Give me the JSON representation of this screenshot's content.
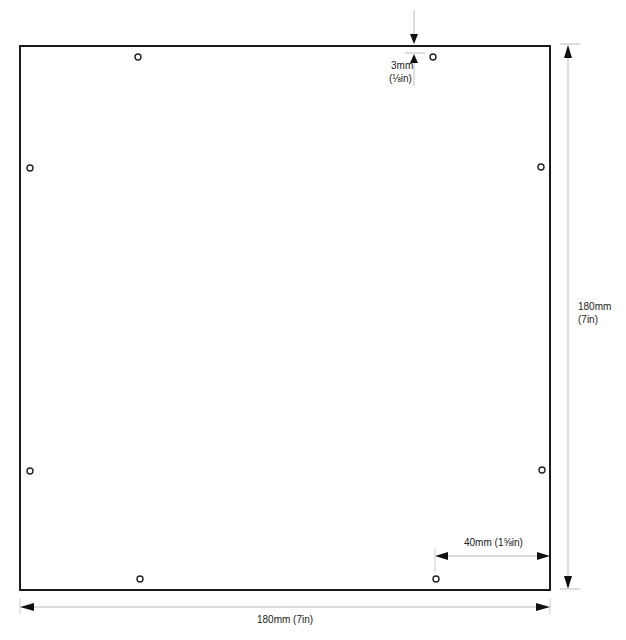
{
  "diagram": {
    "panel": {
      "width_label": "180mm (7in)",
      "height_label_mm": "180mm",
      "height_label_in": "(7in)"
    },
    "edge_offset": {
      "label_mm": "3mm",
      "label_in": "(⅛in)"
    },
    "hole_spacing": {
      "label": "40mm (1⅝in)"
    },
    "holes": [
      {
        "x": 138,
        "y": 57
      },
      {
        "x": 433,
        "y": 57
      },
      {
        "x": 30,
        "y": 168
      },
      {
        "x": 541,
        "y": 167
      },
      {
        "x": 30,
        "y": 471
      },
      {
        "x": 542,
        "y": 470
      },
      {
        "x": 140,
        "y": 579
      },
      {
        "x": 436,
        "y": 579
      }
    ],
    "colors": {
      "outline": "#1a1a1a",
      "dimension": "#bbbbbb",
      "arrow": "#111111"
    }
  }
}
